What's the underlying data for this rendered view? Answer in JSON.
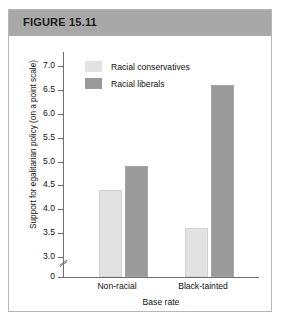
{
  "figure": {
    "header_label": "FIGURE 15.11"
  },
  "chart_data": {
    "type": "bar",
    "title": "",
    "xlabel": "Base rate",
    "ylabel": "Support for egalitarian policy (on a point scale)",
    "categories": [
      "Non-racial",
      "Black-tainted"
    ],
    "series": [
      {
        "name": "Racial conservatives",
        "color": "#e2e2e2",
        "values": [
          4.4,
          3.6
        ]
      },
      {
        "name": "Racial liberals",
        "color": "#9a9a9a",
        "values": [
          4.9,
          6.6
        ]
      }
    ],
    "ylim": [
      3.0,
      7.0
    ],
    "y_axis_break": true,
    "y_break_label": "0",
    "yticks": [
      "7.0",
      "6.5",
      "6.0",
      "5.5",
      "5.0",
      "4.5",
      "4.0",
      "3.5",
      "3.0"
    ],
    "grid": false,
    "legend_position": "top-left-inside"
  }
}
